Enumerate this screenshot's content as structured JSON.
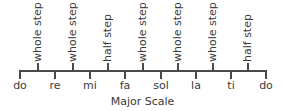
{
  "diagram": {
    "title": "Major Scale",
    "notes": [
      "do",
      "re",
      "mi",
      "fa",
      "sol",
      "la",
      "ti",
      "do"
    ],
    "steps": [
      "whole step",
      "whole step",
      "half step",
      "whole step",
      "whole step",
      "whole step",
      "half step"
    ],
    "line_color": "#4a4a4a",
    "text_color": "#3a3a3a"
  }
}
